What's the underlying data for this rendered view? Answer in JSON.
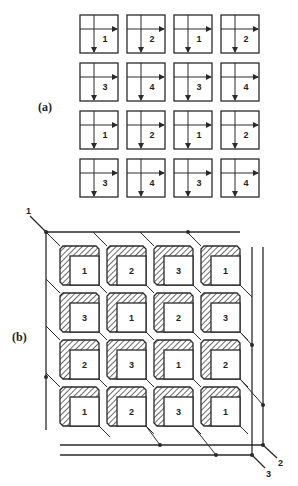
{
  "figure": {
    "part_a": {
      "label": "(a)",
      "rows": [
        [
          "1",
          "2",
          "1",
          "2"
        ],
        [
          "3",
          "4",
          "3",
          "4"
        ],
        [
          "1",
          "2",
          "1",
          "2"
        ],
        [
          "3",
          "4",
          "3",
          "4"
        ]
      ],
      "cell_description": "square cell with a horizontal arrow pointing right and a vertical arrow pointing down"
    },
    "part_b": {
      "label": "(b)",
      "rows": [
        [
          "1",
          "2",
          "3",
          "1"
        ],
        [
          "3",
          "1",
          "2",
          "3"
        ],
        [
          "2",
          "3",
          "1",
          "2"
        ],
        [
          "1",
          "2",
          "3",
          "1"
        ]
      ],
      "line_labels": {
        "line1": "1",
        "line2": "2",
        "line3": "3"
      },
      "block_description": "square block with hatched top and left faces"
    }
  }
}
